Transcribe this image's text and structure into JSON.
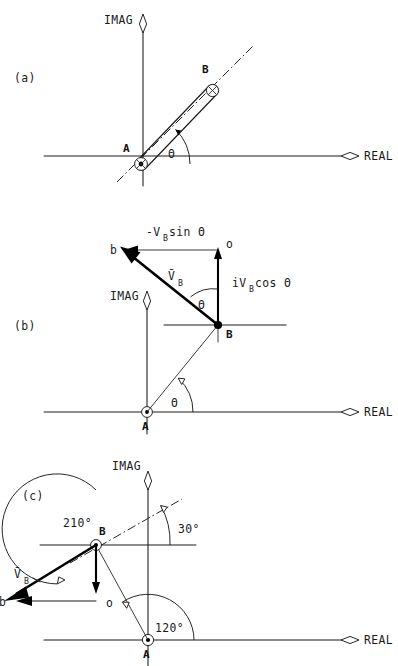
{
  "figure": {
    "background_color": "#ffffff",
    "ink_color": "#1a1a1a",
    "axis_labels": {
      "real": "REAL",
      "imag": "IMAG"
    },
    "theta_glyph": "Θ",
    "degree_glyph": "°"
  },
  "panels": [
    {
      "id": "a",
      "label": "(a)",
      "caption_label": "(a)",
      "axis_real": "REAL",
      "axis_imag": "IMAG",
      "nodes": [
        {
          "name": "A",
          "label": "A",
          "marker": "crossed-circle"
        },
        {
          "name": "B",
          "label": "B",
          "marker": "crossed-circle"
        }
      ],
      "angles": [
        {
          "label": "Θ",
          "from": "REAL",
          "to": "link-AB"
        }
      ],
      "elements": [
        "link-rod-AB",
        "centerline-dash-dot",
        "angle-arc-theta"
      ]
    },
    {
      "id": "b",
      "label": "(b)",
      "caption_label": "(b)",
      "axis_real": "REAL",
      "axis_imag": "IMAG",
      "nodes": [
        {
          "name": "A",
          "label": "A",
          "marker": "crossed-circle"
        },
        {
          "name": "B",
          "label": "B",
          "marker": "filled-dot"
        },
        {
          "name": "b",
          "label": "b",
          "marker": "none"
        },
        {
          "name": "o",
          "label": "o",
          "marker": "none"
        }
      ],
      "vectors": [
        {
          "name": "velocity-B",
          "label": "V̄",
          "subscript": "B",
          "from": "B",
          "to": "b"
        },
        {
          "name": "horizontal-component",
          "label": "-V",
          "subscript": "B",
          "suffix": " sin Θ",
          "from": "o",
          "to": "b"
        },
        {
          "name": "vertical-component",
          "label": "iV",
          "subscript": "B",
          "suffix": " cos Θ",
          "from": "B",
          "to": "o"
        }
      ],
      "labels": {
        "top": "-Vᴮ sin Θ",
        "top_main": "-V",
        "top_sub": "B",
        "top_tail": " sin Θ",
        "vector_main": "V̄",
        "vector_sub": "B",
        "right_main": "iV",
        "right_sub": "B",
        "right_tail": " cos Θ",
        "b_point": "b",
        "o_point": "o",
        "angle_at_B": "Θ",
        "angle_at_A": "Θ"
      },
      "angles": [
        {
          "label": "Θ",
          "at": "B"
        },
        {
          "label": "Θ",
          "at": "A"
        }
      ]
    },
    {
      "id": "c",
      "label": "(c)",
      "caption_label": "(c)",
      "axis_real": "REAL",
      "axis_imag": "IMAG",
      "nodes": [
        {
          "name": "A",
          "label": "A",
          "marker": "crossed-circle"
        },
        {
          "name": "B",
          "label": "B",
          "marker": "crossed-circle"
        },
        {
          "name": "b",
          "label": "b",
          "marker": "none"
        },
        {
          "name": "o",
          "label": "o",
          "marker": "none"
        }
      ],
      "angle_values": [
        {
          "name": "angle-210",
          "value": "210°",
          "at": "B"
        },
        {
          "name": "angle-30",
          "value": "30°",
          "at": "B"
        },
        {
          "name": "angle-120",
          "value": "120°",
          "at": "A"
        }
      ],
      "vectors": [
        {
          "name": "velocity-B",
          "label": "V̄",
          "subscript": "B",
          "from": "B",
          "to": "b"
        }
      ],
      "labels": {
        "vector_main": "V̄",
        "vector_sub": "B",
        "b_point": "b",
        "o_point": "o",
        "node_B": "B",
        "node_A": "A",
        "angle_210": "210°",
        "angle_30": "30°",
        "angle_120": "120°"
      }
    }
  ]
}
